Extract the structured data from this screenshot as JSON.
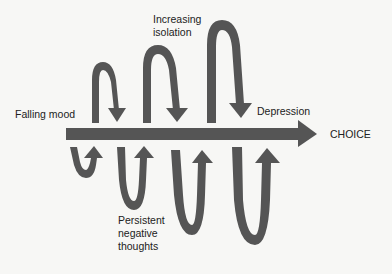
{
  "diagram": {
    "type": "spiral-process",
    "main_arrow": {
      "label": "CHOICE",
      "direction": "right"
    },
    "labels": {
      "falling_mood": "Falling mood",
      "increasing_isolation_1": "Increasing",
      "increasing_isolation_2": "isolation",
      "depression": "Depression",
      "choice": "CHOICE",
      "persistent_1": "Persistent",
      "persistent_2": "negative",
      "persistent_3": "thoughts"
    },
    "colors": {
      "arrow": "#555555",
      "text": "#222222",
      "background": "#f7f7f5"
    }
  }
}
